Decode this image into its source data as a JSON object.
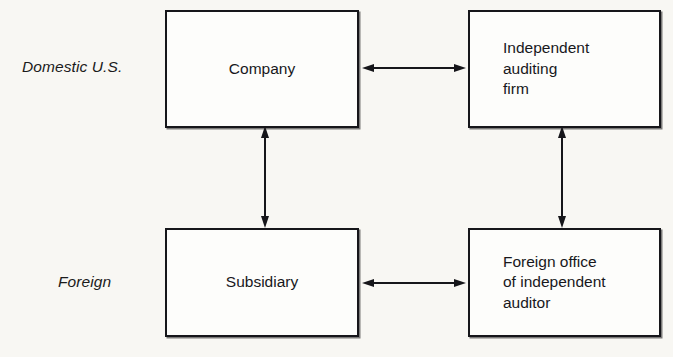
{
  "diagram": {
    "type": "block-relationship-diagram",
    "row_labels": [
      {
        "id": "domestic",
        "text": "Domestic U.S."
      },
      {
        "id": "foreign",
        "text": "Foreign"
      }
    ],
    "nodes": [
      {
        "id": "company",
        "label": "Company",
        "row": "domestic",
        "column": "left"
      },
      {
        "id": "audit-firm",
        "label": "Independent\nauditing\nfirm",
        "row": "domestic",
        "column": "right"
      },
      {
        "id": "subsidiary",
        "label": "Subsidiary",
        "row": "foreign",
        "column": "left"
      },
      {
        "id": "foreign-office",
        "label": "Foreign office\nof independent\nauditor",
        "row": "foreign",
        "column": "right"
      }
    ],
    "connectors": [
      {
        "id": "company-auditfirm",
        "from": "company",
        "to": "audit-firm",
        "orientation": "horizontal",
        "heads": "both"
      },
      {
        "id": "subsidiary-foreignoffice",
        "from": "subsidiary",
        "to": "foreign-office",
        "orientation": "horizontal",
        "heads": "both"
      },
      {
        "id": "company-subsidiary",
        "from": "company",
        "to": "subsidiary",
        "orientation": "vertical",
        "heads": "both"
      },
      {
        "id": "auditfirm-foreignoffice",
        "from": "audit-firm",
        "to": "foreign-office",
        "orientation": "vertical",
        "heads": "both"
      }
    ],
    "colors": {
      "page_background": "#f8f7f3",
      "box_fill": "#fdfdfb",
      "line": "#16161a",
      "text": "#18181c"
    }
  }
}
